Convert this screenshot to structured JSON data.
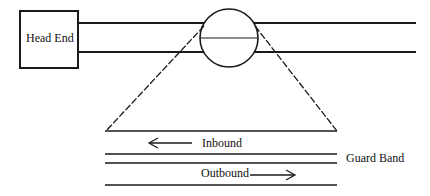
{
  "diagram": {
    "head_end_label": "Head End",
    "inbound_label": "Inbound",
    "outbound_label": "Outbound",
    "guard_band_label": "Guard Band",
    "line_color": "#1a1a1a"
  }
}
